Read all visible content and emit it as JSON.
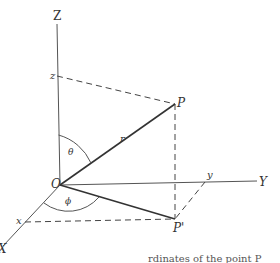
{
  "diagram": {
    "axes": {
      "z_axis_label": "Z",
      "y_axis_label": "Y",
      "x_axis_label": "X"
    },
    "points": {
      "origin_label": "O",
      "point_label": "P",
      "projection_label": "P'",
      "z_intercept_label": "z",
      "y_intercept_label": "y",
      "x_intercept_label": "x"
    },
    "segments": {
      "radius_label": "r"
    },
    "angles": {
      "polar_angle_label": "θ",
      "azimuth_angle_label": "ϕ"
    },
    "caption": "rdinates of the point P",
    "colors": {
      "line": "#333333",
      "dashed": "#444444",
      "background": "#ffffff"
    }
  }
}
